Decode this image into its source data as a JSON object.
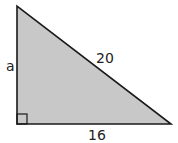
{
  "diagram": {
    "type": "right-triangle",
    "fill_color": "#c8c8c8",
    "stroke_color": "#1a1a1a",
    "labels": {
      "vertical_leg": "a",
      "hypotenuse": "20",
      "horizontal_leg": "16"
    },
    "right_angle_marker": true
  }
}
